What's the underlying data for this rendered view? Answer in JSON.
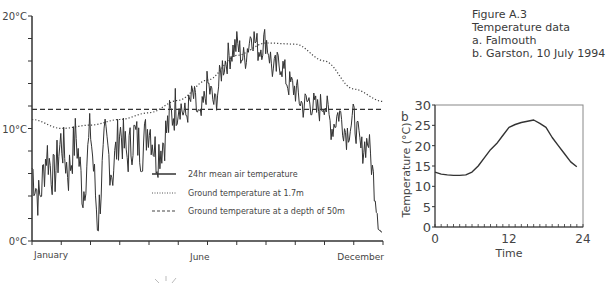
{
  "caption": {
    "figure": "Figure A.3",
    "title": "Temperature data",
    "items": [
      "a. Falmouth",
      "b. Garston, 10 July 1994"
    ]
  },
  "chart_data": [
    {
      "id": "a",
      "type": "line",
      "title": "Falmouth",
      "xlabel": "",
      "ylabel": "",
      "y_tick_labels": [
        "0°C",
        "10°C",
        "20°C"
      ],
      "x_tick_labels": [
        "January",
        "June",
        "December"
      ],
      "ylim": [
        0,
        20
      ],
      "grid": false,
      "legend_position": "lower-right-inside",
      "legend": [
        {
          "label": "24hr mean air temperature",
          "style": "solid"
        },
        {
          "label": "Ground temperature at 1.7m",
          "style": "dotted"
        },
        {
          "label": "Ground temperature at a depth of 50m",
          "style": "dashed"
        }
      ],
      "series": [
        {
          "name": "24hr mean air temperature",
          "style": "solid",
          "note": "daily values over one year (approx. weekly envelope)",
          "x_months": [
            0,
            0.25,
            0.5,
            0.75,
            1,
            1.25,
            1.5,
            1.75,
            2,
            2.25,
            2.5,
            2.75,
            3,
            3.25,
            3.5,
            3.75,
            4,
            4.25,
            4.5,
            4.75,
            5,
            5.25,
            5.5,
            5.75,
            6,
            6.25,
            6.5,
            6.75,
            7,
            7.25,
            7.5,
            7.75,
            8,
            8.25,
            8.5,
            8.75,
            9,
            9.25,
            9.5,
            9.75,
            10,
            10.25,
            10.5,
            10.75,
            11,
            11.25,
            11.5,
            11.75
          ],
          "values": [
            6.5,
            3.5,
            8,
            5.5,
            9,
            6,
            9.5,
            4,
            10,
            1.5,
            9,
            6,
            10,
            7.5,
            9.5,
            8,
            10.5,
            7.5,
            9,
            11,
            12.5,
            11,
            13,
            10.5,
            14,
            12,
            15.5,
            16.5,
            17.5,
            16,
            18.5,
            17,
            18,
            15,
            16,
            14,
            13.5,
            12,
            12.5,
            11.5,
            12.5,
            10,
            11.5,
            9.5,
            11,
            8,
            9,
            4
          ]
        },
        {
          "name": "Ground temperature at 1.7m",
          "style": "dotted",
          "x_months": [
            0,
            1,
            2,
            3,
            4,
            5,
            6,
            7,
            8,
            9,
            10,
            11,
            12
          ],
          "values": [
            10.8,
            10.0,
            10.3,
            10.8,
            11.4,
            12.5,
            14.3,
            16.5,
            17.6,
            17.5,
            16.0,
            13.5,
            12.4
          ]
        },
        {
          "name": "Ground temperature at a depth of 50m",
          "style": "dashed",
          "x_months": [
            0,
            12
          ],
          "values": [
            11.7,
            11.7
          ]
        }
      ]
    },
    {
      "id": "b",
      "type": "line",
      "title": "Garston, 10 July 1994",
      "xlabel": "Time",
      "ylabel": "Temperature (°C)",
      "x_tick_labels": [
        "0",
        "12",
        "24"
      ],
      "y_tick_labels": [
        "0",
        "5",
        "10",
        "15",
        "20",
        "25",
        "30"
      ],
      "xlim": [
        0,
        24
      ],
      "ylim": [
        0,
        30
      ],
      "grid": false,
      "series": [
        {
          "name": "Temperature",
          "x": [
            0,
            1,
            2,
            3,
            4,
            5,
            6,
            7,
            8,
            9,
            10,
            11,
            12,
            13,
            14,
            15,
            16,
            17,
            18,
            19,
            20,
            21,
            22,
            23
          ],
          "values": [
            13.5,
            13.0,
            12.8,
            12.7,
            12.7,
            12.8,
            13.5,
            15.0,
            17.0,
            19.0,
            20.5,
            22.5,
            24.5,
            25.2,
            25.7,
            26.0,
            26.3,
            25.5,
            24.5,
            22.0,
            20.0,
            18.0,
            16.0,
            14.8
          ]
        }
      ]
    }
  ],
  "panel_b_label": "b"
}
